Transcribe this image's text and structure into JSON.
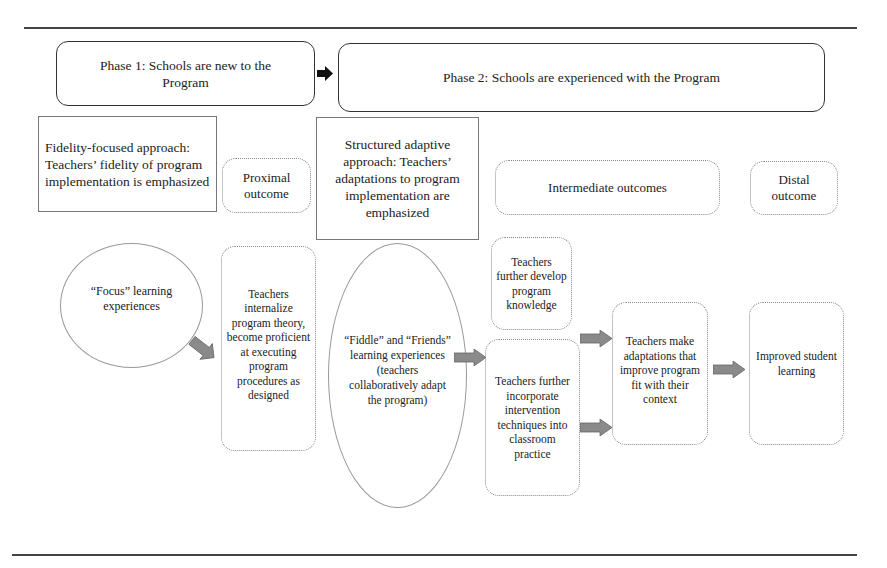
{
  "phases": {
    "phase1": "Phase 1: Schools are new to the Program",
    "phase2": "Phase 2: Schools are experienced with the Program"
  },
  "approaches": {
    "fidelity": "Fidelity-focused approach: Teachers’ fidelity of program implementation is emphasized",
    "adaptive": "Structured adaptive approach: Teachers’ adaptations to program implementation are emphasized"
  },
  "outcome_headers": {
    "proximal": "Proximal outcome",
    "intermediate": "Intermediate outcomes",
    "distal": "Distal outcome"
  },
  "nodes": {
    "focus": "“Focus” learning experiences",
    "internalize": "Teachers internalize program theory, become proficient at executing program procedures as designed",
    "fiddle": "“Fiddle” and “Friends” learning experiences (teachers collaboratively adapt the program)",
    "develop_knowledge": "Teachers further develop program knowledge",
    "incorporate": "Teachers further incorporate intervention techniques into classroom practice",
    "adaptations": "Teachers make adaptations that improve program fit with their context",
    "improved": "Improved student learning"
  },
  "colors": {
    "arrow_fill": "#8a8a8a",
    "arrow_black": "#111111",
    "rule": "#444444"
  }
}
